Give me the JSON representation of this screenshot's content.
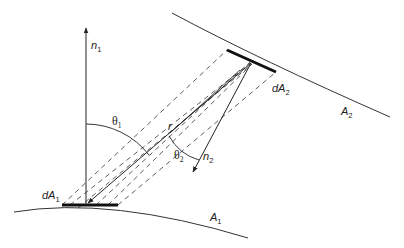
{
  "diagram": {
    "labels": {
      "n1": {
        "base": "n",
        "sub": "1"
      },
      "n2": {
        "base": "n",
        "sub": "2"
      },
      "theta1": {
        "base": "θ",
        "sub": "1"
      },
      "theta2": {
        "base": "θ",
        "sub": "2"
      },
      "r": "r",
      "dA1": {
        "base": "dA",
        "sub": "1"
      },
      "dA2": {
        "base": "dA",
        "sub": "2"
      },
      "A1": {
        "base": "A",
        "sub": "1"
      },
      "A2": {
        "base": "A",
        "sub": "2"
      }
    },
    "colors": {
      "stroke": "#222222",
      "background": "#ffffff"
    }
  }
}
